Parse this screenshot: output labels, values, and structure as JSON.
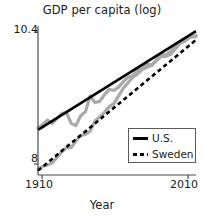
{
  "chart_data": {
    "type": "line",
    "title": "GDP per capita (log)",
    "xlabel": "Year",
    "ylabel": "",
    "xlim": [
      1910,
      2010
    ],
    "ylim": [
      7.8,
      10.55
    ],
    "xticks": [
      1910,
      2010
    ],
    "xtick_labels": [
      "1910",
      "2010"
    ],
    "yticks": [
      8,
      10.4
    ],
    "ytick_labels": [
      "8",
      "10.4"
    ],
    "grid": false,
    "legend_position": "lower-right",
    "series": [
      {
        "name": "U.S.",
        "role": "fitted-trend",
        "style": "solid",
        "color": "#000000",
        "x": [
          1910,
          2010
        ],
        "values": [
          8.62,
          10.42
        ]
      },
      {
        "name": "Sweden",
        "role": "fitted-trend",
        "style": "dashed",
        "color": "#000000",
        "x": [
          1910,
          2010
        ],
        "values": [
          7.88,
          10.26
        ]
      },
      {
        "name": "U.S. observed",
        "role": "observed-data",
        "style": "solid-noisy",
        "color": "#aaaaaa",
        "x": [
          1910,
          1913,
          1916,
          1919,
          1922,
          1925,
          1928,
          1931,
          1934,
          1937,
          1940,
          1943,
          1946,
          1949,
          1952,
          1955,
          1958,
          1961,
          1964,
          1967,
          1970,
          1973,
          1976,
          1979,
          1982,
          1985,
          1988,
          1991,
          1994,
          1997,
          2000,
          2003,
          2006,
          2010
        ],
        "values": [
          8.66,
          8.72,
          8.8,
          8.74,
          8.83,
          8.92,
          8.94,
          8.74,
          8.7,
          8.88,
          8.95,
          9.24,
          9.12,
          9.14,
          9.26,
          9.36,
          9.34,
          9.4,
          9.5,
          9.58,
          9.61,
          9.71,
          9.74,
          9.82,
          9.8,
          9.9,
          9.99,
          9.99,
          10.06,
          10.14,
          10.22,
          10.24,
          10.31,
          10.32
        ]
      },
      {
        "name": "Sweden observed",
        "role": "observed-data",
        "style": "solid-noisy",
        "color": "#aaaaaa",
        "x": [
          1910,
          1913,
          1916,
          1919,
          1922,
          1925,
          1928,
          1931,
          1934,
          1937,
          1940,
          1943,
          1946,
          1949,
          1952,
          1955,
          1958,
          1961,
          1964,
          1967,
          1970,
          1973,
          1976,
          1979,
          1982,
          1985,
          1988,
          1991,
          1994,
          1997,
          2000,
          2003,
          2006,
          2010
        ],
        "values": [
          7.9,
          7.96,
          7.98,
          8.02,
          8.12,
          8.22,
          8.3,
          8.3,
          8.42,
          8.52,
          8.54,
          8.6,
          8.78,
          8.86,
          8.94,
          9.04,
          9.1,
          9.24,
          9.38,
          9.48,
          9.58,
          9.64,
          9.72,
          9.76,
          9.8,
          9.88,
          9.96,
          9.96,
          10.0,
          10.1,
          10.2,
          10.24,
          10.31,
          10.34
        ]
      }
    ],
    "legend_entries": [
      {
        "label": "U.S.",
        "style": "solid"
      },
      {
        "label": "Sweden",
        "style": "dashed"
      }
    ]
  },
  "axis_geometry": {
    "left": 38,
    "right": 196,
    "top": 24,
    "bottom": 175
  },
  "colors": {
    "trend": "#000000",
    "observed": "#aaaaaa",
    "axis": "#4a4a4a",
    "text": "#1a1a1a"
  }
}
